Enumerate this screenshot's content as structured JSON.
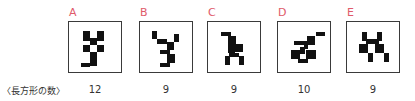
{
  "row_label": "〈長方形の数〉",
  "figures": [
    {
      "letter": "A",
      "count": "12",
      "left": 68,
      "rects": [
        [
          14,
          9,
          7,
          7
        ],
        [
          28,
          9,
          7,
          7
        ],
        [
          21,
          16,
          7,
          7
        ],
        [
          14,
          23,
          7,
          7
        ],
        [
          28,
          23,
          7,
          7
        ],
        [
          21,
          30,
          7,
          7
        ],
        [
          14,
          30,
          0,
          0
        ],
        [
          21,
          37,
          7,
          7
        ],
        [
          12,
          41,
          9,
          4
        ],
        [
          14,
          16,
          7,
          3
        ],
        [
          28,
          16,
          7,
          3
        ],
        [
          14,
          26,
          0,
          0
        ]
      ]
    },
    {
      "letter": "B",
      "count": "9",
      "left": 139,
      "rects": [
        [
          12,
          9,
          5,
          8
        ],
        [
          17,
          17,
          10,
          5
        ],
        [
          27,
          20,
          7,
          8
        ],
        [
          34,
          12,
          5,
          8
        ],
        [
          20,
          28,
          10,
          4
        ],
        [
          27,
          32,
          8,
          9
        ],
        [
          20,
          41,
          10,
          4
        ],
        [
          15,
          23,
          0,
          0
        ],
        [
          24,
          24,
          0,
          0
        ]
      ]
    },
    {
      "letter": "C",
      "count": "9",
      "left": 207,
      "rects": [
        [
          13,
          10,
          10,
          4
        ],
        [
          20,
          14,
          8,
          8
        ],
        [
          20,
          22,
          7,
          9
        ],
        [
          27,
          22,
          8,
          8
        ],
        [
          21,
          31,
          10,
          4
        ],
        [
          17,
          34,
          5,
          9
        ],
        [
          31,
          34,
          5,
          9
        ],
        [
          20,
          26,
          0,
          0
        ],
        [
          30,
          30,
          0,
          0
        ]
      ]
    },
    {
      "letter": "D",
      "count": "10",
      "left": 277,
      "rects": [
        [
          38,
          10,
          9,
          4
        ],
        [
          29,
          14,
          8,
          9
        ],
        [
          16,
          19,
          10,
          4
        ],
        [
          26,
          19,
          4,
          8
        ],
        [
          22,
          25,
          5,
          7
        ],
        [
          13,
          28,
          9,
          9
        ],
        [
          28,
          28,
          10,
          9
        ],
        [
          20,
          37,
          10,
          4
        ],
        [
          33,
          22,
          0,
          0
        ],
        [
          18,
          33,
          0,
          0
        ]
      ]
    },
    {
      "letter": "E",
      "count": "9",
      "left": 346,
      "rects": [
        [
          15,
          10,
          5,
          9
        ],
        [
          30,
          10,
          5,
          9
        ],
        [
          19,
          17,
          13,
          5
        ],
        [
          12,
          22,
          9,
          9
        ],
        [
          28,
          22,
          9,
          9
        ],
        [
          21,
          31,
          5,
          9
        ],
        [
          37,
          31,
          5,
          9
        ],
        [
          24,
          26,
          0,
          0
        ],
        [
          33,
          30,
          0,
          0
        ]
      ]
    }
  ],
  "colors": {
    "letter": "#e05a6a",
    "cell": "#111111",
    "border": "#3a3a3a",
    "text": "#333333"
  }
}
